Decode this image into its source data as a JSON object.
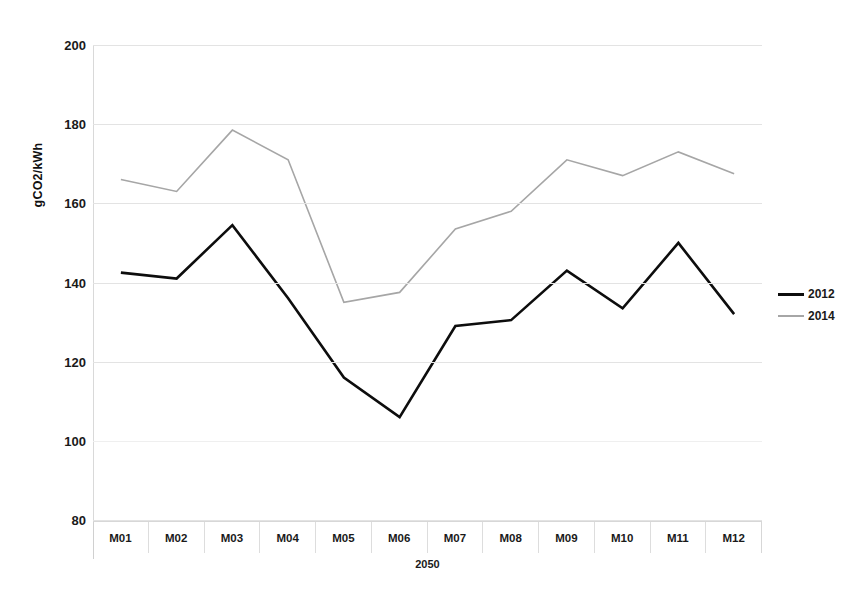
{
  "chart_data": {
    "type": "line",
    "title": "",
    "xlabel": "2050",
    "ylabel": "gCO2/kWh",
    "categories": [
      "M01",
      "M02",
      "M03",
      "M04",
      "M05",
      "M06",
      "M07",
      "M08",
      "M09",
      "M10",
      "M11",
      "M12"
    ],
    "ylim": [
      80,
      200
    ],
    "yticks": [
      200,
      180,
      160,
      140,
      120,
      100,
      80
    ],
    "ytick_labels": [
      "200",
      "180",
      "160",
      "140",
      "120",
      "100",
      "80"
    ],
    "grid": true,
    "legend_position": "right",
    "series": [
      {
        "name": "2012",
        "color": "#0d0d0d",
        "width": 2.6,
        "values": [
          142.5,
          141.0,
          154.5,
          136.0,
          116.0,
          106.0,
          129.0,
          130.5,
          143.0,
          133.5,
          150.0,
          132.0
        ]
      },
      {
        "name": "2014",
        "color": "#a6a6a6",
        "width": 1.6,
        "values": [
          166.0,
          163.0,
          178.5,
          171.0,
          135.0,
          137.5,
          153.5,
          158.0,
          171.0,
          167.0,
          173.0,
          167.5
        ]
      }
    ]
  },
  "legend": {
    "items": [
      {
        "label": "2012"
      },
      {
        "label": "2014"
      }
    ]
  }
}
